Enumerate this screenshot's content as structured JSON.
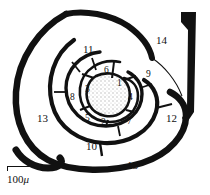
{
  "figure": {
    "type": "scientific-line-drawing",
    "center_fill": "stippled",
    "line_color": "#111111",
    "background_color": "#ffffff",
    "stipple_color": "#d8d8d8"
  },
  "scale_bar": {
    "value": "100",
    "unit": "μ",
    "full_label": "100 μ",
    "length_px": 40
  },
  "chambers": [
    {
      "id": 1,
      "label": "1",
      "x": 117,
      "y": 79,
      "ring": "inner"
    },
    {
      "id": 2,
      "label": "2",
      "x": 101,
      "y": 118,
      "ring": "inner"
    },
    {
      "id": 3,
      "label": "3",
      "x": 85,
      "y": 85,
      "ring": "inner"
    },
    {
      "id": 4,
      "label": "4",
      "x": 128,
      "y": 93,
      "ring": "inner"
    },
    {
      "id": 5,
      "label": "5",
      "x": 85,
      "y": 114,
      "ring": "inner"
    },
    {
      "id": 6,
      "label": "6",
      "x": 104,
      "y": 66,
      "ring": "middle"
    },
    {
      "id": 7,
      "label": "7",
      "x": 127,
      "y": 117,
      "ring": "middle"
    },
    {
      "id": 8,
      "label": "8",
      "x": 70,
      "y": 93,
      "ring": "middle"
    },
    {
      "id": 9,
      "label": "9",
      "x": 146,
      "y": 70,
      "ring": "middle"
    },
    {
      "id": 10,
      "label": "10",
      "x": 86,
      "y": 141,
      "ring": "middle"
    },
    {
      "id": 11,
      "label": "11",
      "x": 83,
      "y": 44,
      "ring": "outer"
    },
    {
      "id": 12,
      "label": "12",
      "x": 166,
      "y": 113,
      "ring": "outer"
    },
    {
      "id": 13,
      "label": "13",
      "x": 37,
      "y": 113,
      "ring": "outer"
    },
    {
      "id": 14,
      "label": "14",
      "x": 156,
      "y": 35,
      "ring": "outer"
    },
    {
      "id": 15,
      "label": "15",
      "x": 127,
      "y": 160,
      "ring": "outer"
    }
  ]
}
